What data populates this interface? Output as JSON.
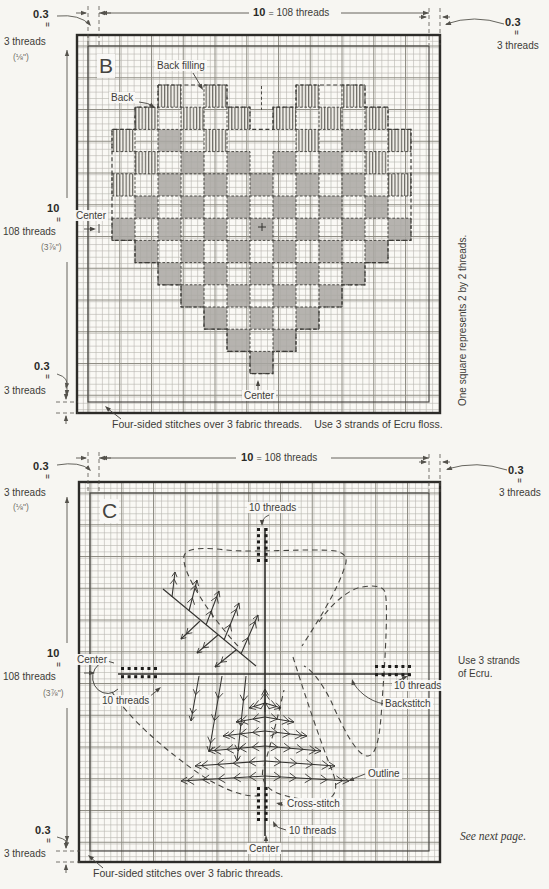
{
  "colors": {
    "paper": "#f7f6f2",
    "grid_line": "#b7b5ae",
    "grid_bold": "#908e85",
    "border": "#2d2c29",
    "block_gray": "#a9a7a2",
    "hatch": "#5f5d57",
    "ink": "#3d3c38",
    "dots": "#1d1c1a",
    "dim": "#55534d"
  },
  "symbols": {
    "eq": "="
  },
  "chartB": {
    "title": "B",
    "top_dim": {
      "num": "10",
      "eq": "=",
      "label": "108 threads"
    },
    "corner_tl": {
      "num": "0.3",
      "threads": "3 threads",
      "inch": "(⅛\")"
    },
    "corner_tr": {
      "num": "0.3",
      "threads": "3 threads"
    },
    "left_dim": {
      "num": "10",
      "label": "108 threads",
      "inch": "(3⅞\")"
    },
    "corner_bl": {
      "num": "0.3",
      "threads": "3 threads"
    },
    "labels": {
      "back_filling": "Back filling",
      "back": "Back",
      "center_left": "Center",
      "center_bottom": "Center"
    },
    "side_note": "One square represents 2 by 2 threads.",
    "caption_1": "Four-sided stitches over 3 fabric threads.",
    "caption_2": "Use 3 strands of Ecru floss.",
    "heart": {
      "origin_x": 112,
      "origin_y": 85,
      "block_w": 23,
      "block_h": 22.2,
      "cells": [
        "..H.H...H.H..",
        ".H.H.H.H.H.H.",
        "H.G.H...H.G.H",
        ".H.G.G.G.G.H.",
        "H.G.G.G.G.G.H",
        ".G.G.G.G.G.G.",
        "G.G.G.G.G.G.G",
        ".G.G.G.G.G.G.",
        "..G.G.G.G.G..",
        "...G.G.G.G...",
        "....G.G.G....",
        ".....G.G.....",
        "......G......"
      ],
      "outline": [
        [
          2,
          0
        ],
        [
          5,
          0
        ],
        [
          5,
          1
        ],
        [
          6,
          1
        ],
        [
          6,
          2
        ],
        [
          7,
          2
        ],
        [
          7,
          1
        ],
        [
          8,
          1
        ],
        [
          8,
          0
        ],
        [
          11,
          0
        ],
        [
          11,
          1
        ],
        [
          12,
          1
        ],
        [
          12,
          2
        ],
        [
          13,
          2
        ],
        [
          13,
          7
        ],
        [
          12,
          7
        ],
        [
          12,
          8
        ],
        [
          11,
          8
        ],
        [
          11,
          9
        ],
        [
          10,
          9
        ],
        [
          10,
          10
        ],
        [
          9,
          10
        ],
        [
          9,
          11
        ],
        [
          8,
          11
        ],
        [
          8,
          12
        ],
        [
          7,
          12
        ],
        [
          7,
          13
        ],
        [
          6,
          13
        ],
        [
          6,
          12
        ],
        [
          5,
          12
        ],
        [
          5,
          11
        ],
        [
          4,
          11
        ],
        [
          4,
          10
        ],
        [
          3,
          10
        ],
        [
          3,
          9
        ],
        [
          2,
          9
        ],
        [
          2,
          8
        ],
        [
          1,
          8
        ],
        [
          1,
          7
        ],
        [
          0,
          7
        ],
        [
          0,
          2
        ],
        [
          1,
          2
        ],
        [
          1,
          1
        ],
        [
          2,
          1
        ],
        [
          2,
          0
        ]
      ]
    }
  },
  "chartC": {
    "title": "C",
    "top_dim": {
      "num": "10",
      "eq": "=",
      "label": "108 threads"
    },
    "corner_tl": {
      "num": "0.3",
      "threads": "3 threads",
      "inch": "(⅛\")"
    },
    "corner_tr": {
      "num": "0.3",
      "threads": "3 threads"
    },
    "left_dim": {
      "num": "10",
      "label": "108 threads",
      "inch": "(3⅞\")"
    },
    "corner_bl": {
      "num": "0.3",
      "threads": "3 threads"
    },
    "labels": {
      "threads_top": "10 threads",
      "center_left": "Center",
      "threads_left": "10 threads",
      "threads_right": "10 threads",
      "backstitch": "Backstitch",
      "outline": "Outline",
      "cross_stitch": "Cross-stitch",
      "threads_bottom": "10 threads",
      "center_bottom": "Center"
    },
    "note_line1": "Use 3 strands",
    "note_line2": "of Ecru.",
    "see_next": "See next page.",
    "caption_1": "Four-sided stitches over 3 fabric threads.",
    "stitch_clusters": [
      {
        "name": "top",
        "x": 257,
        "y": 528,
        "cols": 2,
        "rows": 6,
        "dx": 7.6,
        "dy": 6.2
      },
      {
        "name": "bottom",
        "x": 257,
        "y": 787,
        "cols": 2,
        "rows": 6,
        "dx": 7.6,
        "dy": 6.2
      },
      {
        "name": "left",
        "x": 121,
        "y": 667,
        "cols": 6,
        "rows": 2,
        "dx": 6.6,
        "dy": 8.2
      },
      {
        "name": "right",
        "x": 375,
        "y": 665,
        "cols": 6,
        "rows": 2,
        "dx": 6.6,
        "dy": 8.2
      }
    ]
  }
}
